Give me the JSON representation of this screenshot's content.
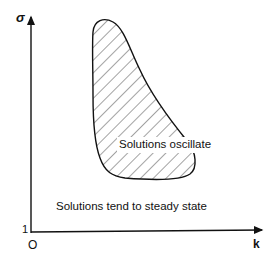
{
  "axes": {
    "y_label": "σ",
    "x_label": "k",
    "origin_label": "O",
    "y_tick_label": "1"
  },
  "regions": {
    "oscillate_label": "Solutions oscillate",
    "steady_label": "Solutions tend to steady state"
  },
  "colors": {
    "ink": "#111111",
    "background": "#ffffff"
  }
}
